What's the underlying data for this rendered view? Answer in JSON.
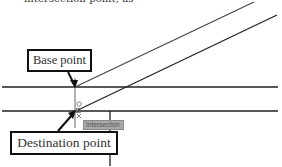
{
  "caption": {
    "text": "intersection point, as"
  },
  "callouts": {
    "base_point": "Base point",
    "destination_point": "Destination point"
  },
  "snap_tooltip": {
    "text": "Intersection"
  },
  "colors": {
    "line": "#222222",
    "callout_border": "#111111",
    "tooltip_bg": "#a8a8a8"
  },
  "geometry": {
    "horizontal_lines_y": [
      87,
      111
    ],
    "diagonals": [
      {
        "from": [
          75,
          87
        ],
        "to": [
          254,
          2
        ]
      },
      {
        "from": [
          78,
          110
        ],
        "to": [
          277,
          15
        ]
      }
    ],
    "vertical_lines": [
      {
        "x": 75,
        "y1": 78,
        "y2": 128
      },
      {
        "x": 110,
        "y1": 111,
        "y2": 166
      }
    ]
  }
}
